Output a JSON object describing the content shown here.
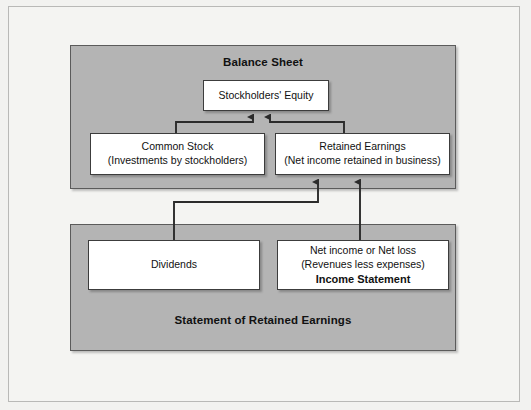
{
  "figure": {
    "width": 531,
    "height": 410,
    "background_color": "#f2f2f0",
    "panel_color": "#b4b4b4",
    "box_color": "#ffffff",
    "line_color": "#2b2b2b"
  },
  "panels": [
    {
      "id": "balance-sheet",
      "title": "Balance Sheet"
    },
    {
      "id": "statement-of-retained-earnings",
      "title": "Statement of Retained Earnings"
    }
  ],
  "boxes": {
    "stockholders_equity": {
      "lines": [
        {
          "text": "Stockholders' Equity",
          "bold": false
        }
      ]
    },
    "common_stock": {
      "lines": [
        {
          "text": "Common Stock",
          "bold": false
        },
        {
          "text": "(Investments by stockholders)",
          "bold": false
        }
      ]
    },
    "retained_earnings": {
      "lines": [
        {
          "text": "Retained Earnings",
          "bold": false
        },
        {
          "text": "(Net income retained in business)",
          "bold": false
        }
      ]
    },
    "dividends": {
      "lines": [
        {
          "text": "Dividends",
          "bold": false
        }
      ]
    },
    "income_statement": {
      "lines": [
        {
          "text": "Net income or Net loss",
          "bold": false
        },
        {
          "text": "(Revenues less expenses)",
          "bold": false
        },
        {
          "text": "Income Statement",
          "bold": true
        }
      ]
    }
  },
  "connectors": [
    {
      "from": "common-stock",
      "to": "stockholders-equity",
      "arrow": "up"
    },
    {
      "from": "retained-earnings",
      "to": "stockholders-equity",
      "arrow": "up"
    },
    {
      "from": "dividends",
      "to": "retained-earnings",
      "arrow": "up"
    },
    {
      "from": "income-statement",
      "to": "retained-earnings",
      "arrow": "up"
    }
  ]
}
